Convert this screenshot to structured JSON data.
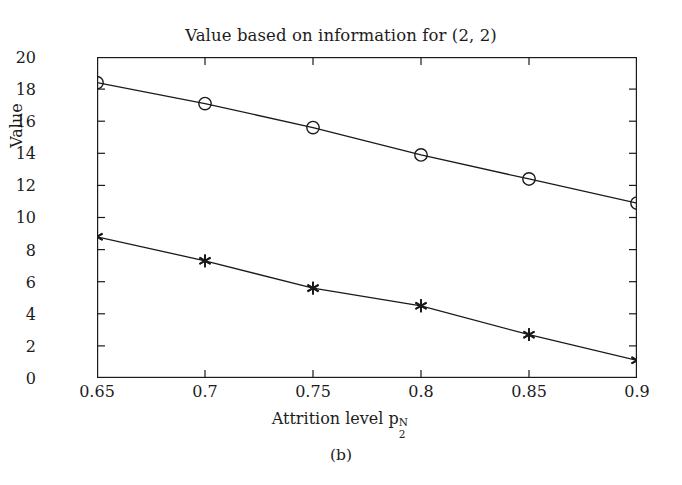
{
  "chart_data": {
    "type": "line",
    "title": "Value based on information for (2, 2)",
    "xlabel_text": "Attrition level p",
    "xlabel_sub": "2",
    "xlabel_sup": "N",
    "ylabel": "Value",
    "caption": "(b)",
    "x": [
      0.65,
      0.7,
      0.75,
      0.8,
      0.85,
      0.9
    ],
    "xlim": [
      0.65,
      0.9
    ],
    "ylim": [
      0,
      20
    ],
    "xticks": [
      "0.65",
      "0.7",
      "0.75",
      "0.8",
      "0.85",
      "0.9"
    ],
    "yticks": [
      "0",
      "2",
      "4",
      "6",
      "8",
      "10",
      "12",
      "14",
      "16",
      "18",
      "20"
    ],
    "grid": false,
    "legend": "none",
    "line_color": "#1a1a1a",
    "series": [
      {
        "name": "upper-curve",
        "marker": "circle",
        "values": [
          18.4,
          17.1,
          15.6,
          13.9,
          12.4,
          10.9
        ]
      },
      {
        "name": "lower-curve",
        "marker": "asterisk",
        "values": [
          8.8,
          7.3,
          5.6,
          4.5,
          2.7,
          1.1
        ]
      }
    ]
  }
}
